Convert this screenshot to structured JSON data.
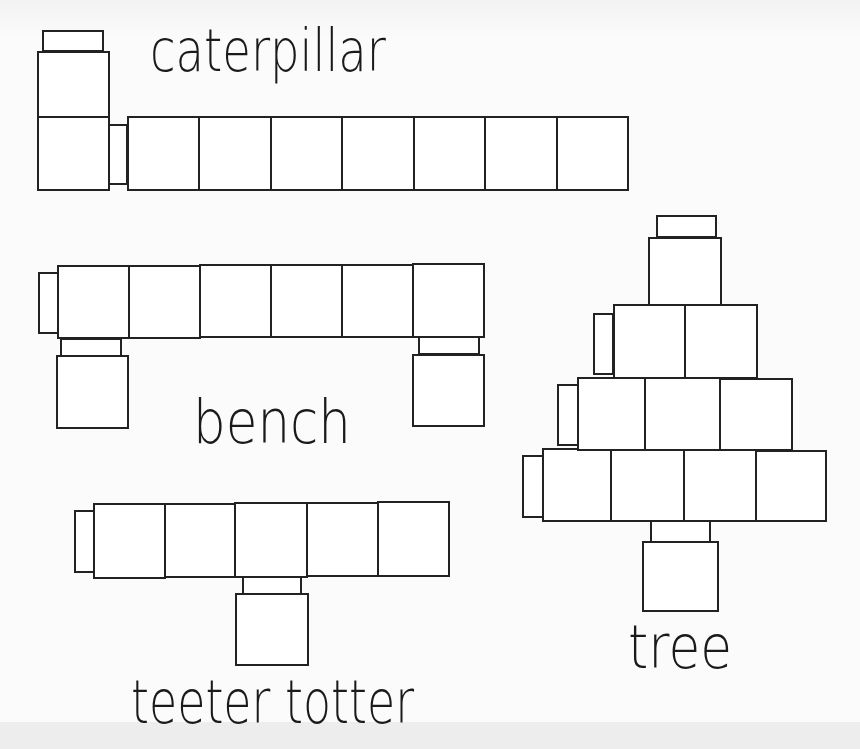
{
  "colors": {
    "stroke": "#222222",
    "fill": "#ffffff",
    "background": "#fbfbfb"
  },
  "figures": [
    {
      "id": "caterpillar",
      "label": "caterpillar",
      "label_box": {
        "x": 150,
        "y": 22,
        "w": 236,
        "font_size": 58
      },
      "cube_count": 8,
      "blocks": [
        {
          "part": "head-cap",
          "x": 42,
          "y": 30,
          "w": 62,
          "h": 22
        },
        {
          "part": "head-cube",
          "x": 37,
          "y": 51,
          "w": 73,
          "h": 67
        },
        {
          "part": "body-cube",
          "x": 37,
          "y": 116,
          "w": 73,
          "h": 75
        },
        {
          "part": "connector",
          "x": 108,
          "y": 124,
          "w": 20,
          "h": 61
        },
        {
          "part": "body-cube",
          "x": 127,
          "y": 116,
          "w": 73,
          "h": 75
        },
        {
          "part": "body-cube",
          "x": 198,
          "y": 116,
          "w": 74,
          "h": 75
        },
        {
          "part": "body-cube",
          "x": 270,
          "y": 116,
          "w": 73,
          "h": 75
        },
        {
          "part": "body-cube",
          "x": 341,
          "y": 116,
          "w": 74,
          "h": 75
        },
        {
          "part": "body-cube",
          "x": 413,
          "y": 116,
          "w": 73,
          "h": 75
        },
        {
          "part": "body-cube",
          "x": 484,
          "y": 116,
          "w": 74,
          "h": 75
        },
        {
          "part": "body-cube",
          "x": 556,
          "y": 116,
          "w": 73,
          "h": 75
        }
      ]
    },
    {
      "id": "bench",
      "label": "bench",
      "label_box": {
        "x": 193,
        "y": 392,
        "w": 158,
        "font_size": 60
      },
      "cube_count": 8,
      "blocks": [
        {
          "part": "end-cap",
          "x": 38,
          "y": 272,
          "w": 21,
          "h": 62
        },
        {
          "part": "seat-cube",
          "x": 57,
          "y": 265,
          "w": 73,
          "h": 74
        },
        {
          "part": "seat-cube",
          "x": 128,
          "y": 265,
          "w": 73,
          "h": 74
        },
        {
          "part": "seat-cube",
          "x": 199,
          "y": 264,
          "w": 73,
          "h": 74
        },
        {
          "part": "seat-cube",
          "x": 270,
          "y": 264,
          "w": 73,
          "h": 74
        },
        {
          "part": "seat-cube",
          "x": 341,
          "y": 264,
          "w": 73,
          "h": 74
        },
        {
          "part": "seat-cube",
          "x": 412,
          "y": 263,
          "w": 73,
          "h": 75
        },
        {
          "part": "left-leg-connector",
          "x": 60,
          "y": 338,
          "w": 62,
          "h": 19
        },
        {
          "part": "left-leg",
          "x": 56,
          "y": 355,
          "w": 73,
          "h": 74
        },
        {
          "part": "right-leg-connector",
          "x": 418,
          "y": 336,
          "w": 62,
          "h": 19
        },
        {
          "part": "right-leg",
          "x": 412,
          "y": 354,
          "w": 73,
          "h": 73
        }
      ]
    },
    {
      "id": "teeter-totter",
      "label": "teeter totter",
      "label_box": {
        "x": 131,
        "y": 672,
        "w": 283,
        "font_size": 60
      },
      "cube_count": 6,
      "blocks": [
        {
          "part": "end-cap",
          "x": 74,
          "y": 510,
          "w": 21,
          "h": 63
        },
        {
          "part": "board-cube",
          "x": 93,
          "y": 503,
          "w": 73,
          "h": 76
        },
        {
          "part": "board-cube",
          "x": 164,
          "y": 503,
          "w": 72,
          "h": 75
        },
        {
          "part": "board-cube",
          "x": 234,
          "y": 502,
          "w": 74,
          "h": 76
        },
        {
          "part": "board-cube",
          "x": 306,
          "y": 502,
          "w": 73,
          "h": 75
        },
        {
          "part": "board-cube",
          "x": 377,
          "y": 501,
          "w": 73,
          "h": 76
        },
        {
          "part": "pivot-connector",
          "x": 242,
          "y": 576,
          "w": 60,
          "h": 19
        },
        {
          "part": "pivot-cube",
          "x": 235,
          "y": 593,
          "w": 74,
          "h": 73
        }
      ]
    },
    {
      "id": "tree",
      "label": "tree",
      "label_box": {
        "x": 628,
        "y": 617,
        "w": 104,
        "font_size": 60
      },
      "cube_count": 11,
      "blocks": [
        {
          "part": "top-cap",
          "x": 656,
          "y": 215,
          "w": 61,
          "h": 23
        },
        {
          "part": "top-cube",
          "x": 648,
          "y": 237,
          "w": 74,
          "h": 69
        },
        {
          "part": "row2-cap",
          "x": 593,
          "y": 313,
          "w": 21,
          "h": 62
        },
        {
          "part": "row2-cube",
          "x": 613,
          "y": 304,
          "w": 73,
          "h": 75
        },
        {
          "part": "row2-cube",
          "x": 684,
          "y": 304,
          "w": 74,
          "h": 75
        },
        {
          "part": "row3-cap",
          "x": 557,
          "y": 384,
          "w": 22,
          "h": 62
        },
        {
          "part": "row3-cube",
          "x": 577,
          "y": 377,
          "w": 69,
          "h": 74
        },
        {
          "part": "row3-cube",
          "x": 644,
          "y": 377,
          "w": 77,
          "h": 74
        },
        {
          "part": "row3-cube",
          "x": 719,
          "y": 378,
          "w": 74,
          "h": 73
        },
        {
          "part": "row4-cap",
          "x": 522,
          "y": 455,
          "w": 22,
          "h": 63
        },
        {
          "part": "row4-cube",
          "x": 542,
          "y": 448,
          "w": 70,
          "h": 74
        },
        {
          "part": "row4-cube",
          "x": 610,
          "y": 449,
          "w": 75,
          "h": 73
        },
        {
          "part": "row4-cube",
          "x": 683,
          "y": 449,
          "w": 74,
          "h": 73
        },
        {
          "part": "row4-cube",
          "x": 755,
          "y": 450,
          "w": 72,
          "h": 72
        },
        {
          "part": "trunk-connector",
          "x": 650,
          "y": 520,
          "w": 61,
          "h": 23
        },
        {
          "part": "trunk-cube",
          "x": 642,
          "y": 541,
          "w": 77,
          "h": 71
        }
      ]
    }
  ]
}
